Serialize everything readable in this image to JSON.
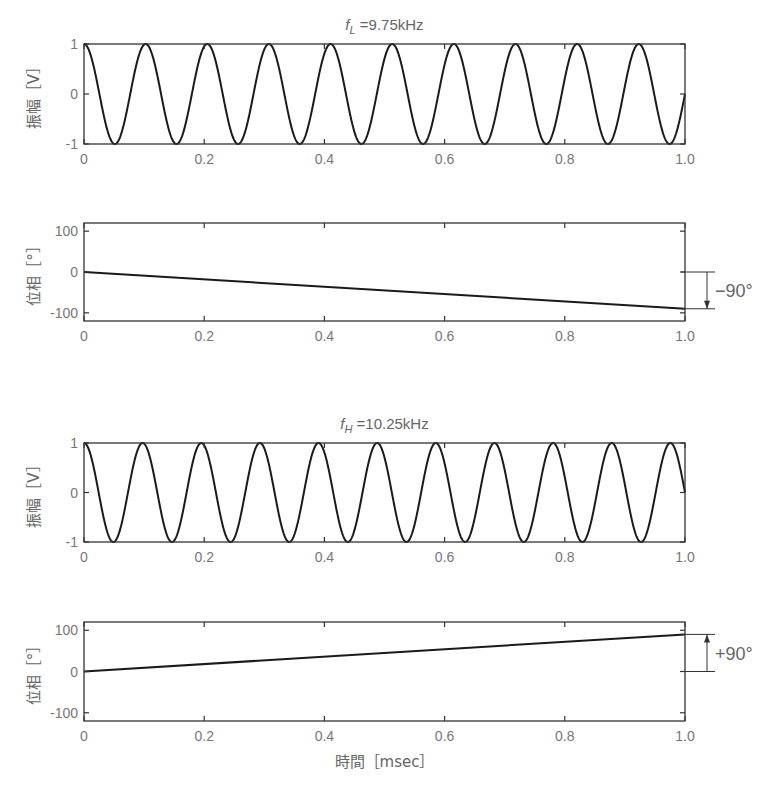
{
  "chart_data": [
    {
      "id": "amp_low",
      "type": "line",
      "title": "f_L =9.75kHz",
      "title_main": "f",
      "title_sub": "L",
      "title_rest": " =9.75kHz",
      "xlabel": "",
      "ylabel": "振幅［V］",
      "xlim": [
        0,
        1.0
      ],
      "ylim": [
        -1,
        1
      ],
      "xticks": [
        0,
        0.2,
        0.4,
        0.6,
        0.8,
        1.0
      ],
      "xtick_labels": [
        "0",
        "0.2",
        "0.4",
        "0.6",
        "0.8",
        "1.0"
      ],
      "yticks": [
        -1,
        0,
        1
      ],
      "ytick_labels": [
        "-1",
        "0",
        "1"
      ],
      "series": [
        {
          "name": "cos(2π·9.75kHz·t)",
          "function": "cos",
          "frequency_khz": 9.75,
          "amplitude": 1
        }
      ],
      "grid": false,
      "frame": {
        "x": 84,
        "y": 44,
        "w": 601,
        "h": 100
      }
    },
    {
      "id": "phase_low",
      "type": "line",
      "title": "",
      "xlabel": "",
      "ylabel": "位相［°］",
      "xlim": [
        0,
        1.0
      ],
      "ylim": [
        -120,
        120
      ],
      "xticks": [
        0,
        0.2,
        0.4,
        0.6,
        0.8,
        1.0
      ],
      "xtick_labels": [
        "0",
        "0.2",
        "0.4",
        "0.6",
        "0.8",
        "1.0"
      ],
      "yticks": [
        -100,
        0,
        100
      ],
      "ytick_labels": [
        "-100",
        "0",
        "100"
      ],
      "series": [
        {
          "name": "phase",
          "x": [
            0,
            1.0
          ],
          "y": [
            0,
            -90
          ]
        }
      ],
      "annotation": {
        "text": "−90°",
        "from": 0,
        "to": -90,
        "direction": "down"
      },
      "grid": false,
      "frame": {
        "x": 84,
        "y": 223,
        "w": 601,
        "h": 98
      }
    },
    {
      "id": "amp_high",
      "type": "line",
      "title": "f_H =10.25kHz",
      "title_main": "f",
      "title_sub": "H",
      "title_rest": " =10.25kHz",
      "xlabel": "",
      "ylabel": "振幅［V］",
      "xlim": [
        0,
        1.0
      ],
      "ylim": [
        -1,
        1
      ],
      "xticks": [
        0,
        0.2,
        0.4,
        0.6,
        0.8,
        1.0
      ],
      "xtick_labels": [
        "0",
        "0.2",
        "0.4",
        "0.6",
        "0.8",
        "1.0"
      ],
      "yticks": [
        -1,
        0,
        1
      ],
      "ytick_labels": [
        "-1",
        "0",
        "1"
      ],
      "series": [
        {
          "name": "cos(2π·10.25kHz·t)",
          "function": "cos",
          "frequency_khz": 10.25,
          "amplitude": 1
        }
      ],
      "grid": false,
      "frame": {
        "x": 84,
        "y": 443,
        "w": 601,
        "h": 99
      }
    },
    {
      "id": "phase_high",
      "type": "line",
      "title": "",
      "xlabel": "時間［msec］",
      "ylabel": "位相［°］",
      "xlim": [
        0,
        1.0
      ],
      "ylim": [
        -120,
        120
      ],
      "xticks": [
        0,
        0.2,
        0.4,
        0.6,
        0.8,
        1.0
      ],
      "xtick_labels": [
        "0",
        "0.2",
        "0.4",
        "0.6",
        "0.8",
        "1.0"
      ],
      "yticks": [
        -100,
        0,
        100
      ],
      "ytick_labels": [
        "-100",
        "0",
        "100"
      ],
      "series": [
        {
          "name": "phase",
          "x": [
            0,
            1.0
          ],
          "y": [
            0,
            90
          ]
        }
      ],
      "annotation": {
        "text": "+90°",
        "from": 0,
        "to": 90,
        "direction": "up"
      },
      "grid": false,
      "frame": {
        "x": 84,
        "y": 622,
        "w": 601,
        "h": 99
      }
    }
  ],
  "colors": {
    "line": "#1a1a1a",
    "frame": "#333333",
    "text": "#666666"
  }
}
